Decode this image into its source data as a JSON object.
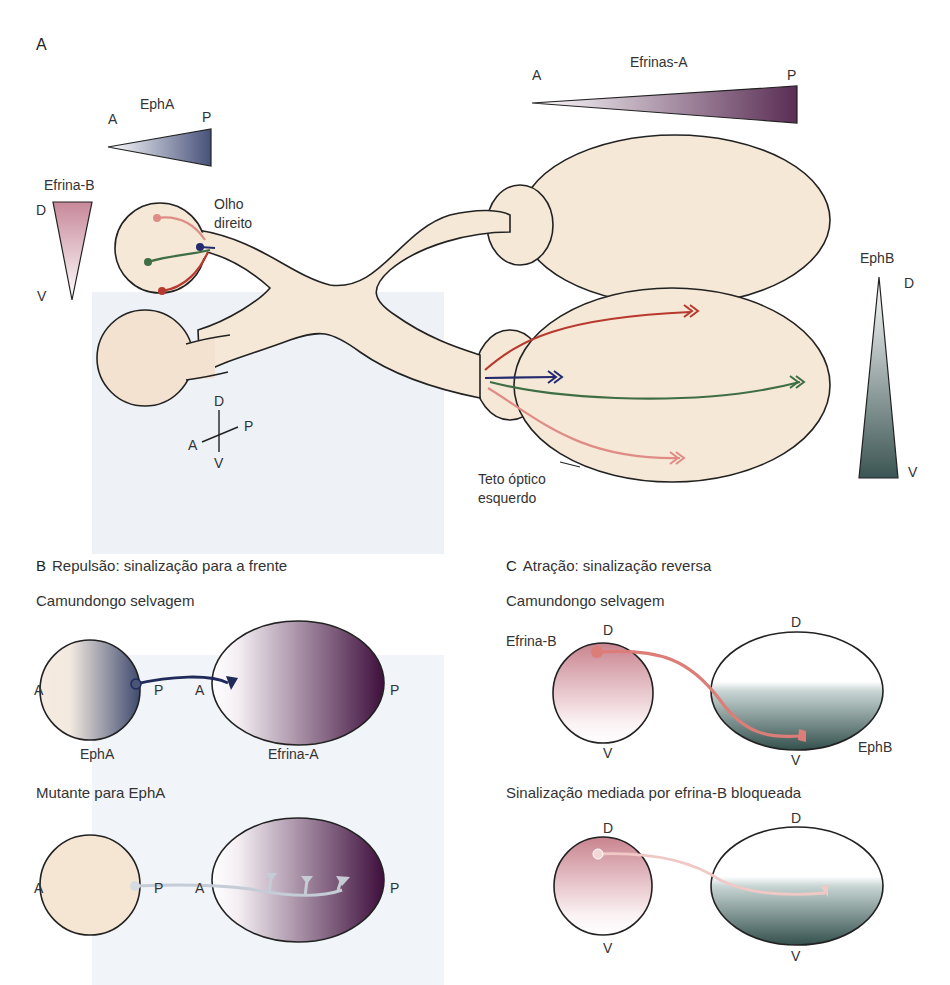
{
  "panel_a": {
    "letter": "A",
    "gradients": {
      "epha": {
        "title": "EphA",
        "start": "A",
        "end": "P",
        "color": "#4a5578"
      },
      "efrina_b": {
        "title": "Efrina-B",
        "start": "D",
        "end": "V",
        "color": "#c88c98"
      },
      "efrinas_a": {
        "title": "Efrinas-A",
        "start": "A",
        "end": "P",
        "color": "#5e3358"
      },
      "ephb": {
        "title": "EphB",
        "start": "D",
        "end": "V",
        "color": "#3f5a58"
      }
    },
    "labels": {
      "right_eye_line1": "Olho",
      "right_eye_line2": "direito",
      "tectum_line1": "Teto óptico",
      "tectum_line2": "esquerdo"
    },
    "axes": {
      "dorsal": "D",
      "ventral": "V",
      "anterior": "A",
      "posterior": "P"
    },
    "axon_colors": {
      "red": "#b8392e",
      "green": "#3f6e45",
      "blue": "#232a6e",
      "pink": "#e08c86"
    },
    "tissue_color": "#f6e8d6"
  },
  "panel_b": {
    "letter": "B",
    "title": "Repulsão: sinalização para a frente",
    "wild_type": {
      "subtitle": "Camundongo selvagem",
      "retina_label": "EphA",
      "tectum_label": "Efrina-A",
      "retina_a": "A",
      "retina_p": "P",
      "tectum_a": "A",
      "tectum_p": "P"
    },
    "mutant": {
      "subtitle": "Mutante para EphA",
      "retina_a": "A",
      "retina_p": "P",
      "tectum_a": "A",
      "tectum_p": "P"
    }
  },
  "panel_c": {
    "letter": "C",
    "title": "Atração: sinalização reversa",
    "wild_type": {
      "subtitle": "Camundongo selvagem",
      "retina_label": "Efrina-B",
      "tectum_label": "EphB",
      "retina_d": "D",
      "retina_v": "V",
      "tectum_d": "D",
      "tectum_v": "V"
    },
    "blocked": {
      "subtitle": "Sinalização mediada por efrina-B bloqueada",
      "retina_d": "D",
      "retina_v": "V",
      "tectum_d": "D",
      "tectum_v": "V"
    }
  }
}
